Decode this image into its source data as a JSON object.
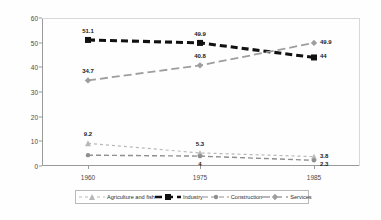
{
  "chart_data": {
    "type": "line",
    "title": "",
    "xlabel": "",
    "ylabel": "",
    "categories": [
      "1960",
      "1975",
      "1985"
    ],
    "x": [
      1960,
      1975,
      1985
    ],
    "ylim": [
      0,
      60
    ],
    "yticks": [
      0,
      10,
      20,
      30,
      40,
      50,
      60
    ],
    "grid": false,
    "legend_position": "bottom",
    "series": [
      {
        "name": "Agriculture and fish",
        "color": "#b8b8b8",
        "marker": "triangle",
        "dash": "3,3",
        "width": 1.2,
        "values": [
          9.2,
          5.3,
          3.8
        ],
        "labels": [
          "9.2",
          "5.3",
          "3.8"
        ]
      },
      {
        "name": "Industry",
        "color": "#111111",
        "marker": "square",
        "dash": "7,4",
        "width": 3.1,
        "values": [
          51.1,
          49.9,
          44
        ],
        "labels": [
          "51.1",
          "49.9",
          "44"
        ]
      },
      {
        "name": "Construction",
        "color": "#8f8f8f",
        "marker": "dot",
        "dash": "5,3",
        "width": 1.4,
        "values": [
          4.4,
          4.0,
          2.3
        ],
        "labels": [
          "",
          "4",
          "2.3"
        ]
      },
      {
        "name": "Services",
        "color": "#9e9e9e",
        "marker": "diamond",
        "dash": "8,4",
        "width": 1.8,
        "values": [
          34.7,
          40.8,
          49.9
        ],
        "labels": [
          "34.7",
          "40.8",
          "49.9"
        ]
      }
    ]
  },
  "axis": {
    "y_tick_labels": [
      "0",
      "10",
      "20",
      "30",
      "40",
      "50",
      "60"
    ],
    "x_tick_labels": [
      "1960",
      "1975",
      "1985"
    ]
  },
  "legend": {
    "items": [
      {
        "label": "Agriculture and fish"
      },
      {
        "label": "Industry"
      },
      {
        "label": "Construction"
      },
      {
        "label": "Services"
      }
    ]
  }
}
